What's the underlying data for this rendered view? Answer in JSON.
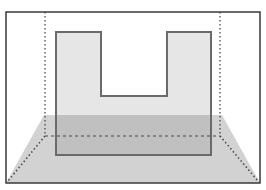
{
  "diagram": {
    "canvas": {
      "width": 266,
      "height": 190
    },
    "colors": {
      "background": "#ffffff",
      "frame_stroke": "#3a3a3a",
      "guide_stroke": "#4a4a4a",
      "floor_fill": "#d2d2d2",
      "u_shape_fill": "#e2e2e2",
      "u_shape_overlap_fill": "#bdbdbd",
      "u_shape_stroke": "#6a6a6a"
    },
    "outer_frame": {
      "x1": 6,
      "y1": 12,
      "x2": 260,
      "y2": 183
    },
    "back_wall_guides": {
      "left_x": 45,
      "right_x": 220,
      "top_y": 12,
      "floor_line_y": 136,
      "style": "dotted"
    },
    "floor": {
      "top_y": 115,
      "top_left_x": 44,
      "top_right_x": 222,
      "bottom_y": 183,
      "bottom_left_x": 6,
      "bottom_right_x": 260
    },
    "perspective_diagonals": [
      {
        "from": [
          45,
          136
        ],
        "to": [
          8,
          181
        ],
        "style": "dotted"
      },
      {
        "from": [
          220,
          136
        ],
        "to": [
          258,
          181
        ],
        "style": "dotted"
      }
    ],
    "u_shape": {
      "outer_left": 56,
      "outer_right": 211,
      "top": 32,
      "bottom": 155,
      "notch_left": 101,
      "notch_right": 167,
      "notch_bottom": 96
    }
  }
}
